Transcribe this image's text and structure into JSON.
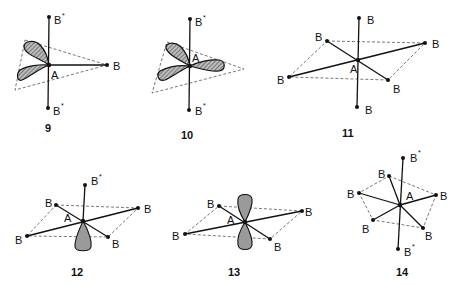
{
  "figures": [
    {
      "id": "9",
      "label": "9",
      "center_atom": "A",
      "ligands": [
        "B*",
        "B",
        "B*"
      ],
      "description": "trigonal with two hatched p-lobes, axial B* ligands"
    },
    {
      "id": "10",
      "label": "10",
      "center_atom": "A",
      "ligands": [
        "B*",
        "B*"
      ],
      "description": "three hatched lobes in trigonal plane, axial B* ligands"
    },
    {
      "id": "11",
      "label": "11",
      "center_atom": "A",
      "ligands": [
        "B",
        "B",
        "B",
        "B",
        "B",
        "B"
      ],
      "description": "octahedral AB6"
    },
    {
      "id": "12",
      "label": "12",
      "center_atom": "A",
      "ligands": [
        "B*",
        "B",
        "B",
        "B",
        "B"
      ],
      "description": "square pyramidal with one lone-pair lobe"
    },
    {
      "id": "13",
      "label": "13",
      "center_atom": "A",
      "ligands": [
        "B",
        "B",
        "B",
        "B"
      ],
      "description": "square planar with p-orbital lobes"
    },
    {
      "id": "14",
      "label": "14",
      "center_atom": "A",
      "ligands": [
        "B*",
        "B",
        "B",
        "B",
        "B",
        "B",
        "B*"
      ],
      "description": "pentagonal bipyramid"
    }
  ],
  "labels": {
    "A": "A",
    "B": "B",
    "star": "*"
  }
}
